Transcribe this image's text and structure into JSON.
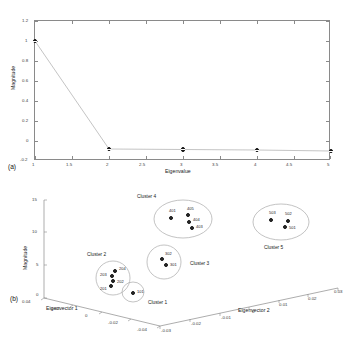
{
  "figure": {
    "panel_a_id": "(a)",
    "panel_b_id": "(b)"
  },
  "colors": {
    "marker": "#1b1b1b",
    "axis": "#8a8a8a",
    "line": "#b5b5b5",
    "ellipse": "#a9a9a9",
    "text": "#222222"
  },
  "panel_a": {
    "xlabel": "Eigenvalue",
    "ylabel": "Magnitude",
    "xticks": [
      "1",
      "1.5",
      "2",
      "2.5",
      "3",
      "3.5",
      "4",
      "4.5",
      "5"
    ],
    "yticks": [
      "1.2",
      "1",
      "0.8",
      "0.6",
      "0.4",
      "0.2",
      "0",
      "-0.2"
    ]
  },
  "panel_b": {
    "xlabel": "Eigenvector 1",
    "ylabel": "Eigenvector 2",
    "zlabel": "Magnitude",
    "x_ticks": [
      "0.04",
      "0.02",
      "0",
      "-0.02",
      "-0.04"
    ],
    "y_ticks": [
      "-0.03",
      "-0.02",
      "-0.01",
      "0",
      "0.01",
      "0.02",
      "0.03"
    ],
    "z_ticks": [
      "15",
      "10",
      "5",
      "0"
    ],
    "cluster_labels": [
      {
        "text": "Cluster 1",
        "x": 148,
        "y": 300
      },
      {
        "text": "Cluster 2",
        "x": 87,
        "y": 252
      },
      {
        "text": "Cluster 3",
        "x": 190,
        "y": 261
      },
      {
        "text": "Cluster 4",
        "x": 137,
        "y": 194
      },
      {
        "text": "Cluster 5",
        "x": 264,
        "y": 245
      }
    ],
    "points": [
      {
        "id": "101",
        "x": 133,
        "y": 293,
        "lx": 137,
        "ly": 293
      },
      {
        "id": "201",
        "x": 111,
        "y": 286,
        "lx": 100,
        "ly": 290
      },
      {
        "id": "202",
        "x": 113,
        "y": 281,
        "lx": 117,
        "ly": 283
      },
      {
        "id": "203",
        "x": 112,
        "y": 276,
        "lx": 100,
        "ly": 276
      },
      {
        "id": "204",
        "x": 115,
        "y": 271,
        "lx": 119,
        "ly": 270
      },
      {
        "id": "301",
        "x": 166,
        "y": 265,
        "lx": 170,
        "ly": 266
      },
      {
        "id": "302",
        "x": 162,
        "y": 259,
        "lx": 165,
        "ly": 255
      },
      {
        "id": "401",
        "x": 171,
        "y": 218,
        "lx": 169,
        "ly": 212
      },
      {
        "id": "403",
        "x": 192,
        "y": 228,
        "lx": 196,
        "ly": 228
      },
      {
        "id": "404",
        "x": 189,
        "y": 222,
        "lx": 193,
        "ly": 221
      },
      {
        "id": "405",
        "x": 188,
        "y": 215,
        "lx": 187,
        "ly": 210
      },
      {
        "id": "501",
        "x": 285,
        "y": 227,
        "lx": 289,
        "ly": 229
      },
      {
        "id": "502",
        "x": 288,
        "y": 221,
        "lx": 285,
        "ly": 215
      },
      {
        "id": "503",
        "x": 271,
        "y": 220,
        "lx": 269,
        "ly": 214
      }
    ]
  },
  "chart_data": [
    {
      "type": "line",
      "title": "(a) Scree plot of eigenvalue magnitudes",
      "xlabel": "Eigenvalue",
      "ylabel": "Magnitude",
      "x": [
        1,
        2,
        3,
        4,
        5
      ],
      "values": [
        1.0,
        -0.08,
        -0.085,
        -0.09,
        -0.1
      ],
      "xlim": [
        1,
        5
      ],
      "ylim": [
        -0.2,
        1.2
      ],
      "xticks": [
        1,
        1.5,
        2,
        2.5,
        3,
        3.5,
        4,
        4.5,
        5
      ],
      "yticks": [
        -0.2,
        0,
        0.2,
        0.4,
        0.6,
        0.8,
        1,
        1.2
      ],
      "grid": false,
      "legend": "none",
      "marker": "circle-with-dot"
    },
    {
      "type": "scatter",
      "title": "(b) 3-D eigenvector cluster plot",
      "xlabel": "Eigenvector 1",
      "ylabel": "Eigenvector 2",
      "zlabel": "Magnitude",
      "xlim": [
        -0.04,
        0.04
      ],
      "ylim": [
        -0.03,
        0.03
      ],
      "zlim": [
        0,
        15
      ],
      "xticks": [
        0.04,
        0.02,
        0,
        -0.02,
        -0.04
      ],
      "yticks": [
        -0.03,
        -0.02,
        -0.01,
        0,
        0.01,
        0.02,
        0.03
      ],
      "zticks": [
        0,
        5,
        10,
        15
      ],
      "grid": false,
      "legend": "none",
      "series": [
        {
          "name": "Cluster 1",
          "points": [
            {
              "label": "101"
            }
          ]
        },
        {
          "name": "Cluster 2",
          "points": [
            {
              "label": "201"
            },
            {
              "label": "202"
            },
            {
              "label": "203"
            },
            {
              "label": "204"
            }
          ]
        },
        {
          "name": "Cluster 3",
          "points": [
            {
              "label": "301"
            },
            {
              "label": "302"
            }
          ]
        },
        {
          "name": "Cluster 4",
          "points": [
            {
              "label": "401"
            },
            {
              "label": "403"
            },
            {
              "label": "404"
            },
            {
              "label": "405"
            }
          ]
        },
        {
          "name": "Cluster 5",
          "points": [
            {
              "label": "501"
            },
            {
              "label": "502"
            },
            {
              "label": "503"
            }
          ]
        }
      ]
    }
  ]
}
